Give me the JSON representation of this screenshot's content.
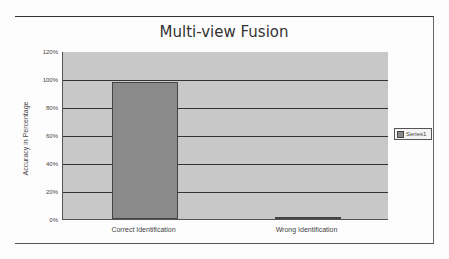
{
  "chart_data": {
    "type": "bar",
    "title": "Multi-view Fusion",
    "xlabel": "",
    "ylabel": "Accuracy in Percentage",
    "categories": [
      "Correct Identification",
      "Wrong Identification"
    ],
    "series": [
      {
        "name": "Series1",
        "values": [
          98,
          1
        ]
      }
    ],
    "ylim": [
      0,
      120
    ],
    "yticks": [
      "0%",
      "20%",
      "40%",
      "60%",
      "80%",
      "100%",
      "120%"
    ],
    "grid": true,
    "legend_position": "right"
  },
  "colors": {
    "plot_background": "#c8c8c8",
    "bar": "#8a8a8a",
    "gridline": "#333333"
  }
}
